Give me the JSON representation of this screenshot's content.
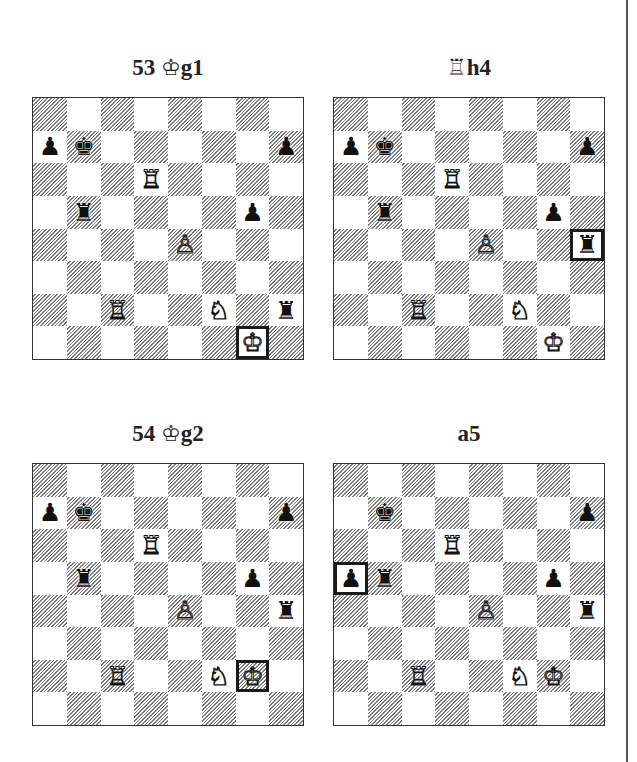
{
  "diagrams": [
    {
      "caption_prefix": "53",
      "caption_piece": "♔",
      "caption_square": "g1",
      "highlight": "g1",
      "pieces": [
        {
          "sq": "b7",
          "type": "king",
          "color": "b"
        },
        {
          "sq": "a7",
          "type": "pawn",
          "color": "b"
        },
        {
          "sq": "h7",
          "type": "pawn",
          "color": "b"
        },
        {
          "sq": "d6",
          "type": "rook",
          "color": "w"
        },
        {
          "sq": "b5",
          "type": "rook",
          "color": "b"
        },
        {
          "sq": "g5",
          "type": "pawn",
          "color": "b"
        },
        {
          "sq": "e4",
          "type": "pawn",
          "color": "w"
        },
        {
          "sq": "c2",
          "type": "rook",
          "color": "w"
        },
        {
          "sq": "f2",
          "type": "knight",
          "color": "w"
        },
        {
          "sq": "h2",
          "type": "rook",
          "color": "b"
        },
        {
          "sq": "g1",
          "type": "king",
          "color": "w"
        }
      ]
    },
    {
      "caption_prefix": "",
      "caption_piece": "♖",
      "caption_square": "h4",
      "highlight": "h4",
      "pieces": [
        {
          "sq": "b7",
          "type": "king",
          "color": "b"
        },
        {
          "sq": "a7",
          "type": "pawn",
          "color": "b"
        },
        {
          "sq": "h7",
          "type": "pawn",
          "color": "b"
        },
        {
          "sq": "d6",
          "type": "rook",
          "color": "w"
        },
        {
          "sq": "b5",
          "type": "rook",
          "color": "b"
        },
        {
          "sq": "g5",
          "type": "pawn",
          "color": "b"
        },
        {
          "sq": "e4",
          "type": "pawn",
          "color": "w"
        },
        {
          "sq": "h4",
          "type": "rook",
          "color": "b"
        },
        {
          "sq": "c2",
          "type": "rook",
          "color": "w"
        },
        {
          "sq": "f2",
          "type": "knight",
          "color": "w"
        },
        {
          "sq": "g1",
          "type": "king",
          "color": "w"
        }
      ]
    },
    {
      "caption_prefix": "54",
      "caption_piece": "♔",
      "caption_square": "g2",
      "highlight": "g2",
      "pieces": [
        {
          "sq": "b7",
          "type": "king",
          "color": "b"
        },
        {
          "sq": "a7",
          "type": "pawn",
          "color": "b"
        },
        {
          "sq": "h7",
          "type": "pawn",
          "color": "b"
        },
        {
          "sq": "d6",
          "type": "rook",
          "color": "w"
        },
        {
          "sq": "b5",
          "type": "rook",
          "color": "b"
        },
        {
          "sq": "g5",
          "type": "pawn",
          "color": "b"
        },
        {
          "sq": "e4",
          "type": "pawn",
          "color": "w"
        },
        {
          "sq": "h4",
          "type": "rook",
          "color": "b"
        },
        {
          "sq": "c2",
          "type": "rook",
          "color": "w"
        },
        {
          "sq": "f2",
          "type": "knight",
          "color": "w"
        },
        {
          "sq": "g2",
          "type": "king",
          "color": "w"
        }
      ]
    },
    {
      "caption_prefix": "",
      "caption_piece": "",
      "caption_square": "a5",
      "highlight": "a5",
      "pieces": [
        {
          "sq": "b7",
          "type": "king",
          "color": "b"
        },
        {
          "sq": "h7",
          "type": "pawn",
          "color": "b"
        },
        {
          "sq": "d6",
          "type": "rook",
          "color": "w"
        },
        {
          "sq": "a5",
          "type": "pawn",
          "color": "b"
        },
        {
          "sq": "b5",
          "type": "rook",
          "color": "b"
        },
        {
          "sq": "g5",
          "type": "pawn",
          "color": "b"
        },
        {
          "sq": "e4",
          "type": "pawn",
          "color": "w"
        },
        {
          "sq": "h4",
          "type": "rook",
          "color": "b"
        },
        {
          "sq": "c2",
          "type": "rook",
          "color": "w"
        },
        {
          "sq": "f2",
          "type": "knight",
          "color": "w"
        },
        {
          "sq": "g2",
          "type": "king",
          "color": "w"
        }
      ]
    }
  ],
  "glyphs": {
    "king": {
      "w": "♔",
      "b": "♚"
    },
    "queen": {
      "w": "♕",
      "b": "♛"
    },
    "rook": {
      "w": "♖",
      "b": "♜"
    },
    "bishop": {
      "w": "♗",
      "b": "♝"
    },
    "knight": {
      "w": "♘",
      "b": "♞"
    },
    "pawn": {
      "w": "♙",
      "b": "♟"
    }
  }
}
